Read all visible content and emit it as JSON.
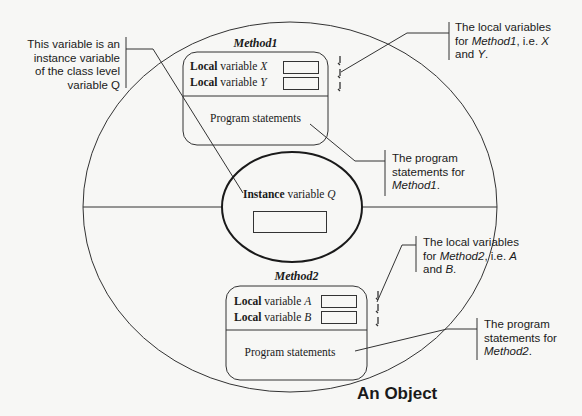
{
  "diagram": {
    "title": "An Object",
    "header_bleed_text": "",
    "colors": {
      "background": "#f7f7f5",
      "stroke": "#333333",
      "text": "#1a1a1a"
    },
    "instance": {
      "label_bold": "Instance",
      "label_rest": " variable ",
      "label_var": "Q"
    },
    "methods": [
      {
        "name": "Method1",
        "variables": [
          {
            "bold": "Local",
            "rest": " variable ",
            "var": "X"
          },
          {
            "bold": "Local",
            "rest": " variable ",
            "var": "Y"
          }
        ],
        "body_label": "Program statements"
      },
      {
        "name": "Method2",
        "variables": [
          {
            "bold": "Local",
            "rest": " variable ",
            "var": "A"
          },
          {
            "bold": "Local",
            "rest": " variable ",
            "var": "B"
          }
        ],
        "body_label": "Program statements"
      }
    ],
    "callouts": {
      "instance_note": {
        "line1": "This variable is an",
        "line2": "instance variable",
        "line3": "of the class level",
        "line4": "variable Q"
      },
      "method1_locals": {
        "line1": "The local variables",
        "line2_pre": "for ",
        "line2_it": "Method1",
        "line2_mid": ", i.e. ",
        "line2_var": "X",
        "line3_pre": "and ",
        "line3_var": "Y",
        "line3_post": "."
      },
      "method1_statements": {
        "line1": "The program",
        "line2": "statements for",
        "line3_it": "Method1",
        "line3_post": "."
      },
      "method2_locals": {
        "line1": "The local variables",
        "line2_pre": "for ",
        "line2_it": "Method2",
        "line2_mid": ", i.e. ",
        "line2_var": "A",
        "line3_pre": "and ",
        "line3_var": "B",
        "line3_post": "."
      },
      "method2_statements": {
        "line1": "The program",
        "line2": "statements for",
        "line3_it": "Method2",
        "line3_post": "."
      }
    }
  }
}
